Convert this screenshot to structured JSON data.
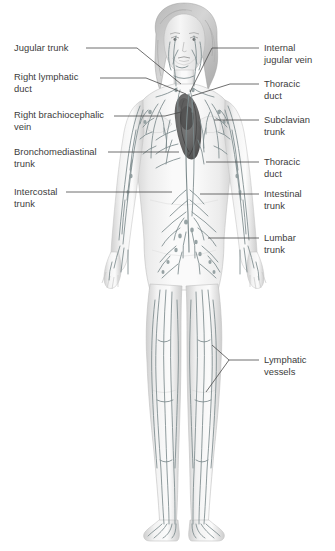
{
  "figure": {
    "background_color": "#ffffff",
    "text_color": "#3c3c3c",
    "leader_line_color": "#4a4a4a",
    "vessel_color": "#7d8a8c",
    "body_fill": "#f2f2f2",
    "body_shade": "#d8d8d8",
    "organ_dark": "#4a4a4a"
  },
  "labels": {
    "left": [
      {
        "id": "jugular-trunk",
        "text": "Jugular trunk"
      },
      {
        "id": "right-lymphatic-duct",
        "text": "Right lymphatic\nduct"
      },
      {
        "id": "right-brachiocephalic-vein",
        "text": "Right brachiocephalic\nvein"
      },
      {
        "id": "bronchomediastinal-trunk",
        "text": "Bronchomediastinal\ntrunk"
      },
      {
        "id": "intercostal-trunk",
        "text": "Intercostal\ntrunk"
      }
    ],
    "right": [
      {
        "id": "internal-jugular-vein",
        "text": "Internal\njugular vein"
      },
      {
        "id": "thoracic-duct-upper",
        "text": "Thoracic\nduct"
      },
      {
        "id": "subclavian-trunk",
        "text": "Subclavian\ntrunk"
      },
      {
        "id": "thoracic-duct-lower",
        "text": "Thoracic\nduct"
      },
      {
        "id": "intestinal-trunk",
        "text": "Intestinal\ntrunk"
      },
      {
        "id": "lumbar-trunk",
        "text": "Lumbar\ntrunk"
      },
      {
        "id": "lymphatic-vessels",
        "text": "Lymphatic\nvessels"
      }
    ]
  }
}
